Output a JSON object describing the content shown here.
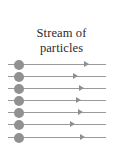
{
  "figure": {
    "width": 123,
    "height": 167,
    "background_color": "#ffffff"
  },
  "caption": {
    "line1": "Stream of",
    "line2": "particles",
    "full_text": "Stream of particles",
    "color": "#2b2b2b"
  },
  "stream": {
    "line_color": "#9a9a9a",
    "arrow_color": "#8f8f8f",
    "particle_color": "#919191",
    "particle_count": 7,
    "rays": [
      {
        "index": 1,
        "y": 64,
        "line_start_x": 8,
        "line_end_x": 106,
        "particle_x": 14,
        "arrow_x": 84
      },
      {
        "index": 2,
        "y": 76,
        "line_start_x": 8,
        "line_end_x": 106,
        "particle_x": 14,
        "arrow_x": 73
      },
      {
        "index": 3,
        "y": 88,
        "line_start_x": 8,
        "line_end_x": 106,
        "particle_x": 14,
        "arrow_x": 79
      },
      {
        "index": 4,
        "y": 100,
        "line_start_x": 8,
        "line_end_x": 106,
        "particle_x": 14,
        "arrow_x": 76
      },
      {
        "index": 5,
        "y": 112,
        "line_start_x": 8,
        "line_end_x": 106,
        "particle_x": 14,
        "arrow_x": 78
      },
      {
        "index": 6,
        "y": 124,
        "line_start_x": 8,
        "line_end_x": 106,
        "particle_x": 14,
        "arrow_x": 70
      },
      {
        "index": 7,
        "y": 137,
        "line_start_x": 8,
        "line_end_x": 106,
        "particle_x": 14,
        "arrow_x": 80
      }
    ]
  }
}
